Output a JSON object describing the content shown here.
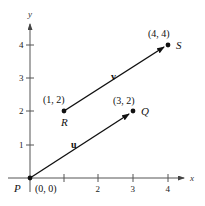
{
  "figure": {
    "axes": {
      "x_label": "x",
      "y_label": "y",
      "x_ticks": [
        "1",
        "2",
        "3",
        "4"
      ],
      "x_tick_labels_shown": [
        "2",
        "3",
        "4"
      ],
      "y_ticks": [
        "1",
        "2",
        "3",
        "4"
      ]
    },
    "points": [
      {
        "name": "P",
        "coords": "(0, 0)",
        "x": 0,
        "y": 0
      },
      {
        "name": "Q",
        "coords": "(3, 2)",
        "x": 3,
        "y": 2
      },
      {
        "name": "R",
        "coords": "(1, 2)",
        "x": 1,
        "y": 2
      },
      {
        "name": "S",
        "coords": "(4, 4)",
        "x": 4,
        "y": 4
      }
    ],
    "vectors": [
      {
        "name": "u",
        "from": "P",
        "to": "Q"
      },
      {
        "name": "v",
        "from": "R",
        "to": "S"
      }
    ],
    "colors": {
      "ink": "#111111",
      "axis": "#555555"
    }
  }
}
